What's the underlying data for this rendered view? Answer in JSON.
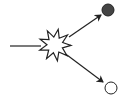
{
  "diagram": {
    "type": "collision-scatter",
    "background": "#ffffff",
    "stroke_color": "#222222",
    "elements": {
      "incoming_line": {
        "from": [
          10,
          46
        ],
        "to": [
          41,
          46
        ]
      },
      "collision_burst": {
        "center": [
          55,
          45
        ],
        "outer_radius": 16,
        "inner_radius": 8,
        "points": 9,
        "fill": "#ffffff"
      },
      "outgoing_arrows": [
        {
          "name": "arrow-to-filled-particle",
          "from": [
            69,
            37
          ],
          "to": [
            101,
            15
          ]
        },
        {
          "name": "arrow-to-open-particle",
          "from": [
            67,
            55
          ],
          "to": [
            103,
            82
          ]
        }
      ],
      "particles": [
        {
          "name": "filled-particle",
          "center": [
            108,
            10
          ],
          "radius": 6,
          "fill": "#444444"
        },
        {
          "name": "open-particle",
          "center": [
            111,
            88
          ],
          "radius": 6,
          "fill": "#ffffff"
        }
      ]
    }
  }
}
